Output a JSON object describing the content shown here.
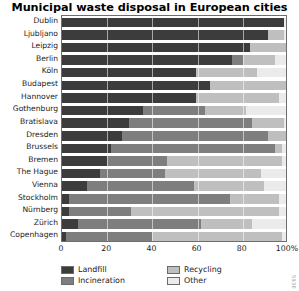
{
  "chart_data": {
    "type": "bar",
    "orientation": "horizontal",
    "stacked": true,
    "normalized": true,
    "title": "Municipal waste disposal in European cities",
    "xlabel": "",
    "ylabel": "",
    "xlim": [
      0,
      100
    ],
    "xticks": [
      0,
      20,
      40,
      60,
      80,
      100
    ],
    "xtick_labels": [
      "0",
      "20",
      "40",
      "60",
      "80",
      "100%"
    ],
    "grid": true,
    "grid_axis": "x",
    "legend_position": "bottom",
    "categories": [
      "Dublin",
      "Ljubljano",
      "Leipzig",
      "Berlin",
      "Köln",
      "Budapest",
      "Hannover",
      "Gothenburg",
      "Bratislava",
      "Dresden",
      "Brussels",
      "Bremen",
      "The Hague",
      "Vienna",
      "Stockholm",
      "Nürnberg",
      "Zürich",
      "Copenhagen"
    ],
    "series": [
      {
        "name": "Landfill",
        "color": "#3c3c3c",
        "values": [
          99,
          92,
          84,
          76,
          60,
          66,
          60,
          36,
          30,
          27,
          22,
          20,
          17,
          11,
          3,
          3,
          7,
          2
        ]
      },
      {
        "name": "Incineration",
        "color": "#7e7e7e",
        "values": [
          0,
          0,
          0,
          5,
          0,
          0,
          0,
          28,
          55,
          65,
          73,
          27,
          29,
          48,
          72,
          28,
          55,
          38
        ]
      },
      {
        "name": "Recycling",
        "color": "#bfbfbf",
        "values": [
          0,
          7,
          16,
          14,
          27,
          34,
          37,
          18,
          14,
          8,
          3,
          51,
          43,
          31,
          22,
          66,
          23,
          58
        ]
      },
      {
        "name": "Other",
        "color": "#ebebeb",
        "values": [
          1,
          1,
          0,
          5,
          13,
          0,
          3,
          18,
          1,
          0,
          2,
          2,
          11,
          10,
          3,
          3,
          15,
          2
        ]
      }
    ]
  },
  "legend": {
    "entries": [
      {
        "label": "Landfill",
        "swatch": "#3c3c3c"
      },
      {
        "label": "Incineration",
        "swatch": "#7e7e7e"
      },
      {
        "label": "Recycling",
        "swatch": "#bfbfbf"
      },
      {
        "label": "Other",
        "swatch": "#ebebeb"
      }
    ]
  },
  "side_credit": "5936"
}
